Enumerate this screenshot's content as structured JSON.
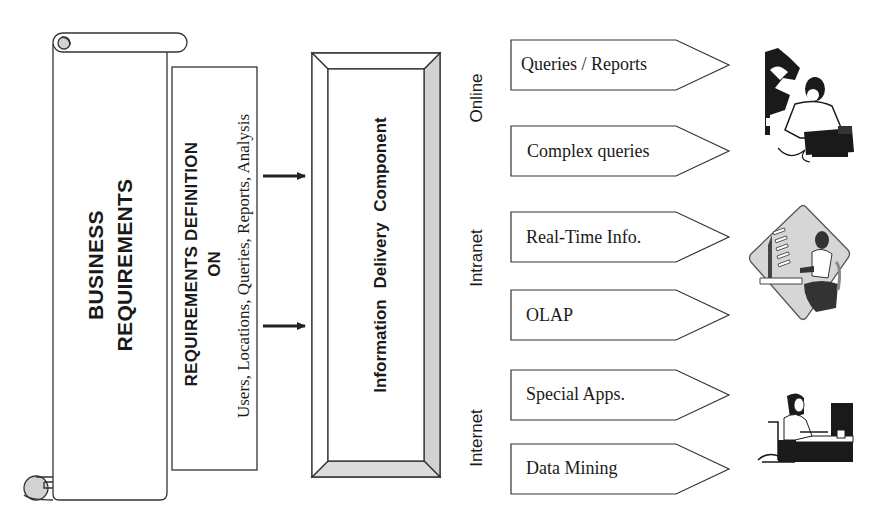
{
  "diagram": {
    "business_requirements": {
      "line1": "BUSINESS",
      "line2": "REQUIREMENTS"
    },
    "requirements_definition": {
      "title": "REQUIREMENTS DEFINITION",
      "connector": "ON",
      "subjects": "Users, Locations, Queries, Reports, Analysis"
    },
    "information_delivery": {
      "label": "Information Delivery Component"
    },
    "channels": [
      {
        "name": "Online",
        "outputs": [
          "Queries / Reports",
          "Complex queries"
        ],
        "illustration": "man-at-laptop-illustration"
      },
      {
        "name": "Intranet",
        "outputs": [
          "Real-Time Info.",
          "OLAP"
        ],
        "illustration": "person-at-computer-diamond-illustration"
      },
      {
        "name": "Internet",
        "outputs": [
          "Special Apps.",
          "Data Mining"
        ],
        "illustration": "woman-in-wheelchair-at-computer-illustration"
      }
    ],
    "colors": {
      "line": "#333333",
      "shade": "#d4d4d4",
      "text": "#1a1a1a",
      "background": "#ffffff"
    }
  }
}
